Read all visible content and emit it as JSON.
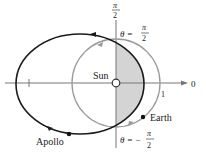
{
  "diagram": {
    "type": "polar-orbit-diagram",
    "axis_labels": {
      "polar_axis": "0",
      "vertical_axis_num": "π",
      "vertical_axis_den": "2",
      "unit_tick": "1"
    },
    "angle_labels": {
      "top": {
        "prefix": "θ =",
        "num": "π",
        "den": "2"
      },
      "bottom": {
        "prefix": "θ = −",
        "num": "π",
        "den": "2"
      }
    },
    "bodies": {
      "sun": "Sun",
      "earth": "Earth",
      "apollo": "Apollo"
    },
    "colors": {
      "apollo_orbit": "#1a1a1a",
      "earth_orbit": "#9a9a9a",
      "shaded_region": "#d4d4d4",
      "axes": "#777777"
    }
  }
}
